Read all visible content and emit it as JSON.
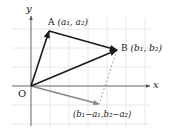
{
  "diagram": {
    "axes": {
      "x_label": "x",
      "y_label": "y",
      "origin_label": "O"
    },
    "points": {
      "A": {
        "name": "A",
        "coords": "(a₁, a₂)"
      },
      "B": {
        "name": "B",
        "coords": "(b₁, b₂)"
      },
      "D": {
        "coords": "(b₁−a₁,b₂−a₂)"
      }
    },
    "colors": {
      "vector": "#1a1a1a",
      "difference_vector": "#888888",
      "grid": "#e2e2e2",
      "axis": "#555555"
    }
  }
}
